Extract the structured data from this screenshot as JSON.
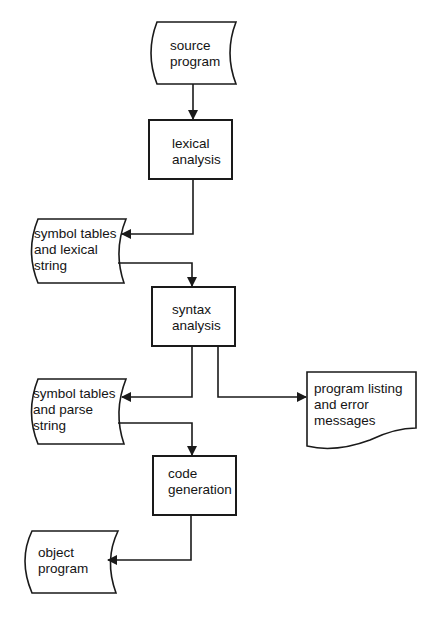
{
  "diagram": {
    "type": "flowchart",
    "title": "",
    "nodes": [
      {
        "id": "source",
        "shape": "stored-data",
        "label": "source\nprogram"
      },
      {
        "id": "lexical",
        "shape": "process",
        "label": "lexical\nanalysis"
      },
      {
        "id": "symtab_lex",
        "shape": "stored-data",
        "label": "symbol tables\nand lexical\nstring"
      },
      {
        "id": "syntax",
        "shape": "process",
        "label": "syntax\nanalysis"
      },
      {
        "id": "symtab_parse",
        "shape": "stored-data",
        "label": "symbol tables\nand parse\nstring"
      },
      {
        "id": "listing",
        "shape": "document",
        "label": "program listing\nand error\nmessages"
      },
      {
        "id": "codegen",
        "shape": "process",
        "label": "code\ngeneration"
      },
      {
        "id": "object",
        "shape": "stored-data",
        "label": "object\nprogram"
      }
    ],
    "edges": [
      {
        "from": "source",
        "to": "lexical"
      },
      {
        "from": "lexical",
        "to": "symtab_lex"
      },
      {
        "from": "symtab_lex",
        "to": "syntax"
      },
      {
        "from": "syntax",
        "to": "symtab_parse"
      },
      {
        "from": "syntax",
        "to": "listing"
      },
      {
        "from": "symtab_parse",
        "to": "codegen"
      },
      {
        "from": "codegen",
        "to": "object"
      }
    ]
  },
  "labels": {
    "source": "source\nprogram",
    "lexical": "lexical\nanalysis",
    "symtab_lex": "symbol  tables\nand lexical\nstring",
    "syntax": "syntax\nanalysis",
    "symtab_parse": "symbol  tables\nand parse\nstring",
    "listing": "program listing\nand error\nmessages",
    "codegen": "code\ngeneration",
    "object": "object\nprogram"
  },
  "colors": {
    "stroke": "#1a1a1a",
    "background": "#ffffff"
  }
}
